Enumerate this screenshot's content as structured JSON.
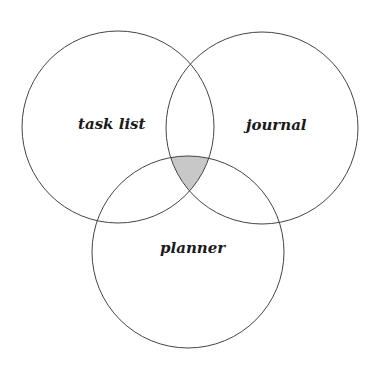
{
  "diagram": {
    "type": "venn",
    "sets": [
      {
        "label": "task list",
        "cx": 118,
        "cy": 127,
        "r": 96,
        "label_x": 78,
        "label_y": 129
      },
      {
        "label": "journal",
        "cx": 262,
        "cy": 128,
        "r": 96,
        "label_x": 274,
        "label_y": 130
      },
      {
        "label": "planner",
        "cx": 188,
        "cy": 252,
        "r": 96,
        "label_x": 192,
        "label_y": 254
      }
    ],
    "highlight": {
      "region": "task list ∩ journal ∩ planner",
      "fill": "#c8c8c8"
    },
    "stroke_color": "#444444"
  }
}
